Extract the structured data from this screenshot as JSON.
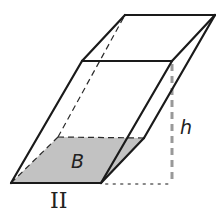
{
  "figure": {
    "type": "oblique-prism",
    "labels": {
      "base": "B",
      "height": "h",
      "figure_number": "II"
    },
    "colors": {
      "edge": "#1a1a1a",
      "base_fill": "#c2c2c2",
      "height_line": "#999999",
      "background": "#ffffff"
    },
    "vertices": {
      "bottom_front_left": [
        11,
        183
      ],
      "bottom_front_right": [
        101,
        183
      ],
      "bottom_back_right": [
        144,
        138
      ],
      "bottom_back_left": [
        58,
        137
      ],
      "top_front_left": [
        82,
        61
      ],
      "top_front_right": [
        172,
        61
      ],
      "top_back_right": [
        215,
        15
      ],
      "top_back_left": [
        125,
        15
      ]
    }
  }
}
